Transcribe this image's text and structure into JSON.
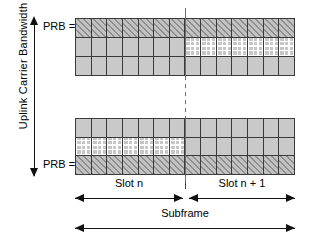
{
  "diagram": {
    "y_axis": {
      "label": "Uplink Carrier Bandwidth",
      "top_tick_label": "PRB = n",
      "bottom_tick_label": "PRB = 0",
      "arrow_style": "double-headed"
    },
    "x_axis": {
      "slot_left_label": "Slot n",
      "slot_right_label": "Slot n + 1",
      "subframe_label": "Subframe",
      "arrow_style": "double-headed"
    },
    "legend_fills": {
      "hatch": "diagonal-hatch",
      "cross": "white-cross-hatch",
      "plain": "plain-gray"
    },
    "colors": {
      "grid_fill": "#c9c9c9",
      "grid_border": "#3a3a3a",
      "hatch_line": "#8e8e8e",
      "cross_line": "#ffffff",
      "divider": "#6e6e6e",
      "axis": "#111111",
      "background": "#ffffff"
    },
    "columns_per_slot": 7,
    "total_columns": 14,
    "grids": [
      {
        "name": "top-grid",
        "position": "top",
        "rows": [
          {
            "name": "row-top",
            "cells": [
              "hatch",
              "hatch",
              "hatch",
              "hatch",
              "hatch",
              "hatch",
              "hatch",
              "hatch",
              "hatch",
              "hatch",
              "hatch",
              "hatch",
              "hatch",
              "hatch"
            ]
          },
          {
            "name": "row-middle",
            "cells": [
              "plain",
              "plain",
              "plain",
              "plain",
              "plain",
              "plain",
              "plain",
              "cross",
              "cross",
              "cross",
              "cross",
              "cross",
              "cross",
              "cross"
            ]
          },
          {
            "name": "row-bottom",
            "cells": [
              "plain",
              "plain",
              "plain",
              "plain",
              "plain",
              "plain",
              "plain",
              "plain",
              "plain",
              "plain",
              "plain",
              "plain",
              "plain",
              "plain"
            ]
          }
        ]
      },
      {
        "name": "bottom-grid",
        "position": "bottom",
        "rows": [
          {
            "name": "row-top",
            "cells": [
              "plain",
              "plain",
              "plain",
              "plain",
              "plain",
              "plain",
              "plain",
              "plain",
              "plain",
              "plain",
              "plain",
              "plain",
              "plain",
              "plain"
            ]
          },
          {
            "name": "row-middle",
            "cells": [
              "cross",
              "cross",
              "cross",
              "cross",
              "cross",
              "cross",
              "cross",
              "plain",
              "plain",
              "plain",
              "plain",
              "plain",
              "plain",
              "plain"
            ]
          },
          {
            "name": "row-bottom",
            "cells": [
              "hatch",
              "hatch",
              "hatch",
              "hatch",
              "hatch",
              "hatch",
              "hatch",
              "hatch",
              "hatch",
              "hatch",
              "hatch",
              "hatch",
              "hatch",
              "hatch"
            ]
          }
        ]
      }
    ]
  }
}
